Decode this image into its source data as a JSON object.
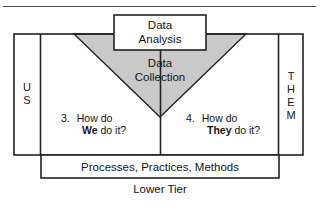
{
  "diagram": {
    "title_absent": "",
    "colors": {
      "stroke": "#222222",
      "triangle_fill": "#c9c9c9",
      "box_fill": "#ffffff",
      "text": "#141414",
      "rule": "#4a4a4a"
    },
    "top_box": {
      "name": "data-analysis-box",
      "line1": "Data",
      "line2": "Analysis"
    },
    "triangle": {
      "name": "data-collection-triangle",
      "line1": "Data",
      "line2": "Collection"
    },
    "left_column": {
      "name": "us-column",
      "label": "US",
      "letters": [
        "U",
        "S"
      ]
    },
    "right_column": {
      "name": "them-column",
      "label": "THEM",
      "letters": [
        "T",
        "H",
        "E",
        "M"
      ]
    },
    "questions": [
      {
        "number": "3.",
        "line1": "How do",
        "emphasis": "We",
        "line2_rest": " do it?"
      },
      {
        "number": "4.",
        "line1": "How do",
        "emphasis": "They",
        "line2_rest": " do it?"
      }
    ],
    "lower_box": {
      "name": "processes-box",
      "label": "Processes, Practices, Methods"
    },
    "caption": {
      "name": "lower-tier-caption",
      "label": "Lower Tier"
    }
  }
}
